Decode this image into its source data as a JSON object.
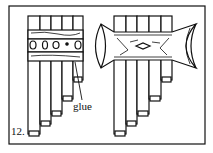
{
  "figure": {
    "number": "12.",
    "annotation": "glue",
    "left_panpipe": {
      "pipes": 5,
      "bindings": "two bands with cut-outs (glue applied)"
    },
    "right_panpipe": {
      "pipes": 5,
      "decoration": "carved crescent binding with diamond motif"
    },
    "colors": {
      "line": "#111111",
      "background": "#ffffff"
    }
  }
}
